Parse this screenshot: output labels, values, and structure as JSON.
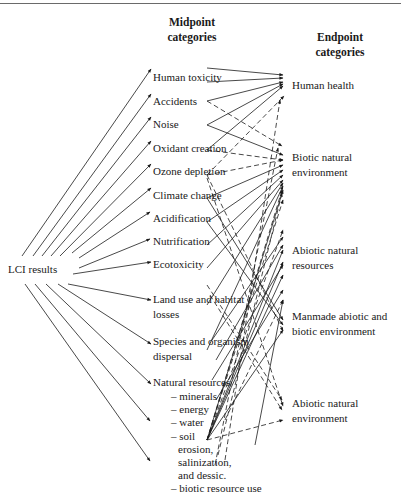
{
  "headers": {
    "midpoint": [
      "Midpoint",
      "categories"
    ],
    "endpoint": [
      "Endpoint",
      "categories"
    ]
  },
  "source": {
    "label": "LCI results",
    "x": 8,
    "y": 262
  },
  "midpoints": [
    {
      "id": "human-toxicity",
      "lines": [
        "Human toxicity"
      ],
      "x": 153,
      "y": 70,
      "anchor_y": 76
    },
    {
      "id": "accidents",
      "lines": [
        "Accidents"
      ],
      "x": 153,
      "y": 94,
      "anchor_y": 100
    },
    {
      "id": "noise",
      "lines": [
        "Noise"
      ],
      "x": 153,
      "y": 117,
      "anchor_y": 123
    },
    {
      "id": "oxidant-creation",
      "lines": [
        "Oxidant creation"
      ],
      "x": 153,
      "y": 141,
      "anchor_y": 147
    },
    {
      "id": "ozone-depletion",
      "lines": [
        "Ozone depletion"
      ],
      "x": 153,
      "y": 164,
      "anchor_y": 170
    },
    {
      "id": "climate-change",
      "lines": [
        "Climate change"
      ],
      "x": 153,
      "y": 188,
      "anchor_y": 194
    },
    {
      "id": "acidification",
      "lines": [
        "Acidification"
      ],
      "x": 153,
      "y": 211,
      "anchor_y": 216
    },
    {
      "id": "nutrification",
      "lines": [
        "Nutrification"
      ],
      "x": 153,
      "y": 234,
      "anchor_y": 240
    },
    {
      "id": "ecotoxicity",
      "lines": [
        "Ecotoxicity"
      ],
      "x": 153,
      "y": 257,
      "anchor_y": 263
    },
    {
      "id": "land-use",
      "lines": [
        "Land use and habitat",
        "losses"
      ],
      "x": 153,
      "y": 292,
      "anchor_y": 299
    },
    {
      "id": "species-dispersal",
      "lines": [
        "Species and organism",
        "dispersal"
      ],
      "x": 153,
      "y": 334,
      "anchor_y": 341
    },
    {
      "id": "natural-resources",
      "lines": [
        "Natural resources"
      ],
      "x": 153,
      "y": 375,
      "anchor_y": 380,
      "sub_items": [
        "– minerals",
        "– energy",
        "– water",
        "– soil",
        "erosion,",
        "salinization,",
        "and dessic.",
        "– biotic resource use"
      ]
    }
  ],
  "endpoints": [
    {
      "id": "human-health",
      "lines": [
        "Human health"
      ],
      "x": 292,
      "y": 78
    },
    {
      "id": "biotic-natural-environment",
      "lines": [
        "Biotic natural",
        "environment"
      ],
      "x": 292,
      "y": 150
    },
    {
      "id": "abiotic-natural-resources",
      "lines": [
        "Abiotic natural",
        "resources"
      ],
      "x": 292,
      "y": 243
    },
    {
      "id": "manmade-environment",
      "lines": [
        "Manmade abiotic and",
        "biotic environment"
      ],
      "x": 292,
      "y": 309
    },
    {
      "id": "abiotic-natural-environment",
      "lines": [
        "Abiotic natural",
        "environment"
      ],
      "x": 292,
      "y": 396
    }
  ],
  "source_arrows": [
    {
      "to": [
        151,
        69
      ]
    },
    {
      "to": [
        151,
        94
      ]
    },
    {
      "to": [
        151,
        117
      ]
    },
    {
      "to": [
        151,
        141
      ]
    },
    {
      "to": [
        151,
        164
      ]
    },
    {
      "to": [
        151,
        188
      ]
    },
    {
      "to": [
        150,
        212
      ]
    },
    {
      "to": [
        150,
        239
      ]
    },
    {
      "to": [
        151,
        262
      ]
    },
    {
      "to": [
        151,
        300
      ]
    },
    {
      "to": [
        151,
        344
      ]
    },
    {
      "to": [
        151,
        384
      ]
    },
    {
      "to": [
        150,
        421
      ]
    },
    {
      "to": [
        150,
        461
      ]
    }
  ],
  "source_origins": {
    "upper": [
      [
        22,
        265
      ],
      [
        33,
        265
      ],
      [
        42,
        265
      ],
      [
        52,
        265
      ],
      [
        60,
        265
      ],
      [
        70,
        265
      ],
      [
        79,
        258
      ],
      [
        79,
        268
      ],
      [
        73,
        273
      ]
    ],
    "lower": [
      [
        25,
        283
      ],
      [
        35,
        283
      ],
      [
        45,
        283
      ],
      [
        58,
        283
      ],
      [
        68,
        283
      ]
    ]
  },
  "links": [
    {
      "from": [
        207,
        68
      ],
      "to": [
        283,
        75
      ],
      "dash": false
    },
    {
      "from": [
        207,
        82
      ],
      "to": [
        283,
        78
      ],
      "dash": false
    },
    {
      "from": [
        207,
        101
      ],
      "to": [
        283,
        82
      ],
      "dash": false
    },
    {
      "from": [
        207,
        101
      ],
      "to": [
        282,
        146
      ],
      "dash": true
    },
    {
      "from": [
        207,
        125
      ],
      "to": [
        283,
        84
      ],
      "dash": false
    },
    {
      "from": [
        207,
        125
      ],
      "to": [
        283,
        155
      ],
      "dash": false
    },
    {
      "from": [
        207,
        150
      ],
      "to": [
        283,
        86
      ],
      "dash": false
    },
    {
      "from": [
        207,
        150
      ],
      "to": [
        283,
        160
      ],
      "dash": true
    },
    {
      "from": [
        207,
        175
      ],
      "to": [
        283,
        160
      ],
      "dash": true
    },
    {
      "from": [
        207,
        175
      ],
      "to": [
        284,
        96
      ],
      "dash": true
    },
    {
      "from": [
        207,
        175
      ],
      "to": [
        283,
        331
      ],
      "dash": true
    },
    {
      "from": [
        207,
        178
      ],
      "to": [
        283,
        406
      ],
      "dash": true
    },
    {
      "from": [
        207,
        198
      ],
      "to": [
        283,
        165
      ],
      "dash": false
    },
    {
      "from": [
        207,
        198
      ],
      "to": [
        283,
        320
      ],
      "dash": false
    },
    {
      "from": [
        207,
        222
      ],
      "to": [
        283,
        170
      ],
      "dash": false
    },
    {
      "from": [
        207,
        222
      ],
      "to": [
        283,
        325
      ],
      "dash": false
    },
    {
      "from": [
        207,
        245
      ],
      "to": [
        283,
        175
      ],
      "dash": false
    },
    {
      "from": [
        207,
        268
      ],
      "to": [
        283,
        180
      ],
      "dash": false
    },
    {
      "from": [
        207,
        305
      ],
      "to": [
        283,
        183
      ],
      "dash": false
    },
    {
      "from": [
        207,
        350
      ],
      "to": [
        283,
        186
      ],
      "dash": false
    },
    {
      "from": [
        207,
        285
      ],
      "to": [
        282,
        400
      ],
      "dash": true
    },
    {
      "from": [
        210,
        295
      ],
      "to": [
        282,
        410
      ],
      "dash": true
    },
    {
      "from": [
        207,
        440
      ],
      "to": [
        283,
        420
      ],
      "dash": true
    },
    {
      "from": [
        207,
        440
      ],
      "to": [
        283,
        330
      ],
      "dash": false
    },
    {
      "from": [
        207,
        440
      ],
      "to": [
        283,
        275
      ],
      "dash": false
    },
    {
      "from": [
        207,
        440
      ],
      "to": [
        283,
        262
      ],
      "dash": false
    },
    {
      "from": [
        207,
        440
      ],
      "to": [
        283,
        250
      ],
      "dash": false
    },
    {
      "from": [
        207,
        440
      ],
      "to": [
        283,
        230
      ],
      "dash": true
    },
    {
      "from": [
        207,
        440
      ],
      "to": [
        283,
        200
      ],
      "dash": true
    },
    {
      "from": [
        207,
        440
      ],
      "to": [
        282,
        190
      ],
      "dash": true
    },
    {
      "from": [
        207,
        440
      ],
      "to": [
        283,
        190
      ],
      "dash": false
    },
    {
      "from": [
        218,
        455
      ],
      "to": [
        282,
        193
      ],
      "dash": true
    },
    {
      "from": [
        215,
        465
      ],
      "to": [
        278,
        148
      ],
      "dash": true
    },
    {
      "from": [
        225,
        460
      ],
      "to": [
        280,
        100
      ],
      "dash": true
    },
    {
      "from": [
        212,
        340
      ],
      "to": [
        283,
        237
      ],
      "dash": false
    },
    {
      "from": [
        216,
        360
      ],
      "to": [
        283,
        245
      ],
      "dash": false
    },
    {
      "from": [
        212,
        380
      ],
      "to": [
        283,
        265
      ],
      "dash": false
    },
    {
      "from": [
        216,
        400
      ],
      "to": [
        283,
        290
      ],
      "dash": false
    },
    {
      "from": [
        225,
        420
      ],
      "to": [
        283,
        300
      ],
      "dash": true
    },
    {
      "from": [
        255,
        445
      ],
      "to": [
        283,
        300
      ],
      "dash": false
    }
  ],
  "style": {
    "line_color": "#1a1a1a",
    "text_color": "#1a1a1a",
    "rule_color": "#6a6a6a"
  }
}
